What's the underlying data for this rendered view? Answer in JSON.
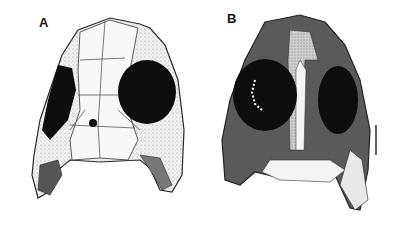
{
  "figure": {
    "panels": [
      {
        "label": "A",
        "description": "skull drawing, dorsal view, line art"
      },
      {
        "label": "B",
        "description": "skull drawing, shaded reconstruction"
      }
    ],
    "colors": {
      "background": "#ffffff",
      "outline": "#2a2a2a",
      "orbit": "#0d0d0d",
      "bone_light": "#f4f4f4",
      "bone_stippled": "#d9d9d9",
      "bone_dark": "#5a5a5a"
    }
  }
}
